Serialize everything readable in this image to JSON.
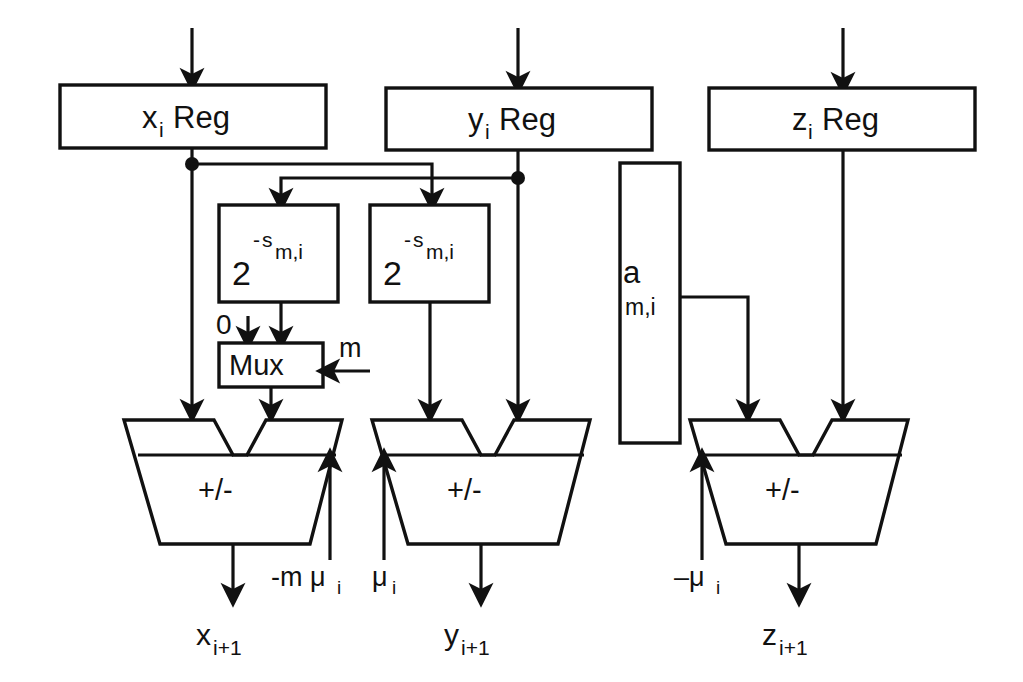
{
  "diagram": {
    "registers": [
      {
        "id": "x-reg",
        "base": "x",
        "sub": "i",
        "suffix": " Reg"
      },
      {
        "id": "y-reg",
        "base": "y",
        "sub": "i",
        "suffix": " Reg"
      },
      {
        "id": "z-reg",
        "base": "z",
        "sub": "i",
        "suffix": " Reg"
      }
    ],
    "shifters": [
      {
        "id": "shifter-left",
        "base": "2",
        "exp_sign": "-",
        "exp_base": "s",
        "exp_sub": "m,i"
      },
      {
        "id": "shifter-right",
        "base": "2",
        "exp_sign": "-",
        "exp_base": "s",
        "exp_sub": "m,i"
      }
    ],
    "mux": {
      "label": "Mux",
      "zero_input_label": "0",
      "select_label": "m"
    },
    "rom": {
      "base": "a",
      "sub": "m,i"
    },
    "adders": [
      {
        "id": "adder-x",
        "label": "+/-",
        "control_base": "-m μ",
        "control_sub": "i"
      },
      {
        "id": "adder-y",
        "label": "+/-",
        "control_base": "μ",
        "control_sub": "i"
      },
      {
        "id": "adder-z",
        "label": "+/-",
        "control_base": "–μ",
        "control_sub": "i"
      }
    ],
    "outputs": [
      {
        "id": "out-x",
        "base": "x",
        "sub": "i+1"
      },
      {
        "id": "out-y",
        "base": "y",
        "sub": "i+1"
      },
      {
        "id": "out-z",
        "base": "z",
        "sub": "i+1"
      }
    ],
    "colors": {
      "ink": "#111111",
      "paper": "#ffffff"
    }
  }
}
